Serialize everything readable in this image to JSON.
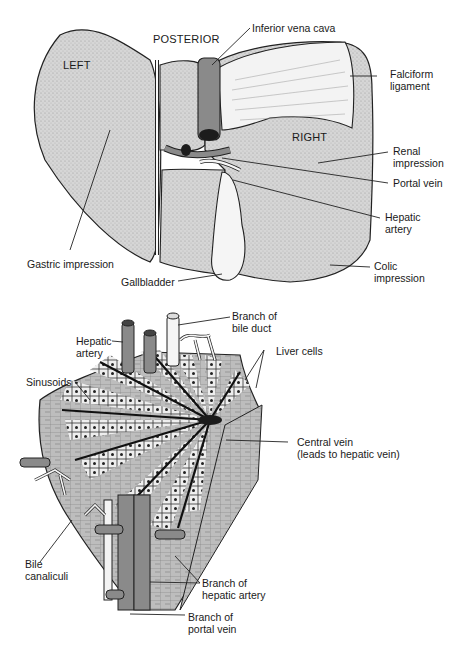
{
  "figure": {
    "top_view": {
      "orientation_labels": {
        "posterior": "POSTERIOR",
        "left": "LEFT",
        "right": "RIGHT"
      },
      "labels": {
        "inferior_vena_cava": "Inferior vena cava",
        "falciform_1": "Falciform",
        "falciform_2": "ligament",
        "renal_1": "Renal",
        "renal_2": "impression",
        "portal_vein": "Portal vein",
        "hepatic_artery_1": "Hepatic",
        "hepatic_artery_2": "artery",
        "gastric_impression": "Gastric impression",
        "gallbladder": "Gallbladder",
        "colic_1": "Colic",
        "colic_2": "impression"
      }
    },
    "bottom_view": {
      "labels": {
        "bile_duct_1": "Branch of",
        "bile_duct_2": "bile duct",
        "hepatic_artery_1": "Hepatic",
        "hepatic_artery_2": "artery",
        "liver_cells": "Liver cells",
        "sinusoids": "Sinusoids",
        "central_vein_1": "Central vein",
        "central_vein_2": "(leads to hepatic vein)",
        "bile_canaliculi_1": "Bile",
        "bile_canaliculi_2": "canaliculi",
        "branch_hepatic_artery_1": "Branch of",
        "branch_hepatic_artery_2": "hepatic artery",
        "branch_portal_vein_1": "Branch of",
        "branch_portal_vein_2": "portal vein"
      }
    },
    "colors": {
      "liver_fill": "#d4d4d4",
      "vessel_fill": "#8a8a8a",
      "dark": "#1c1c1c",
      "ligament": "#f2f2f2",
      "line": "#222222"
    }
  }
}
